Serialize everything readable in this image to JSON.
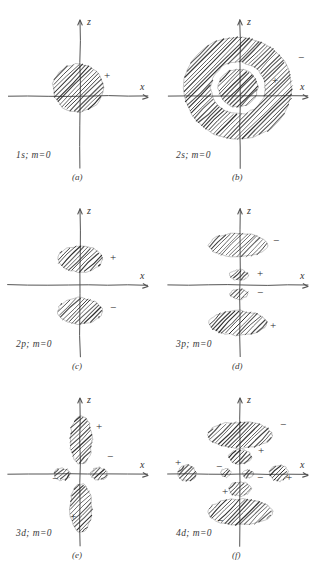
{
  "figure": {
    "background_color": "#ffffff",
    "ink_color": "#2b2b2b",
    "axis_color": "#555555"
  },
  "axes": {
    "vertical_label": "z",
    "horizontal_label": "x"
  },
  "panels": [
    {
      "id": "a",
      "caption": "(a)",
      "orbital_label": "1s; m=0",
      "orbital": "1s",
      "m": 0,
      "signs": [
        {
          "text": "+",
          "x": 104,
          "y": 79
        }
      ],
      "lobes": [
        {
          "name": "s-core-lobe",
          "shape": "disc",
          "cx": 78,
          "cy": 88,
          "rx": 25,
          "ry": 24,
          "sign": "+",
          "rotation": 0
        }
      ]
    },
    {
      "id": "b",
      "caption": "(b)",
      "orbital_label": "2s; m=0",
      "orbital": "2s",
      "m": 0,
      "signs": [
        {
          "text": "+",
          "x": 112,
          "y": 84
        },
        {
          "text": "−",
          "x": 138,
          "y": 61
        }
      ],
      "lobes": [
        {
          "name": "outer-ring",
          "shape": "annulus",
          "cx": 78,
          "cy": 88,
          "rx": 54,
          "ry": 51,
          "inner_rx": 27,
          "inner_ry": 26,
          "sign": "−"
        },
        {
          "name": "inner-disc",
          "shape": "disc",
          "cx": 78,
          "cy": 88,
          "rx": 20,
          "ry": 19,
          "sign": "+"
        }
      ]
    },
    {
      "id": "c",
      "caption": "(c)",
      "orbital_label": "2p; m=0",
      "orbital": "2p",
      "m": 0,
      "signs": [
        {
          "text": "+",
          "x": 110,
          "y": 72
        },
        {
          "text": "−",
          "x": 110,
          "y": 122
        }
      ],
      "lobes": [
        {
          "name": "upper-lobe",
          "shape": "disc",
          "cx": 80,
          "cy": 70,
          "rx": 22,
          "ry": 13,
          "sign": "+"
        },
        {
          "name": "lower-lobe",
          "shape": "disc",
          "cx": 80,
          "cy": 122,
          "rx": 22,
          "ry": 13,
          "sign": "−"
        }
      ]
    },
    {
      "id": "d",
      "caption": "(d)",
      "orbital_label": "3p; m=0",
      "orbital": "3p",
      "m": 0,
      "signs": [
        {
          "text": "−",
          "x": 113,
          "y": 55
        },
        {
          "text": "+",
          "x": 97,
          "y": 88
        },
        {
          "text": "−",
          "x": 97,
          "y": 107
        },
        {
          "text": "+",
          "x": 110,
          "y": 140
        }
      ],
      "lobes": [
        {
          "name": "outer-upper-lobe",
          "shape": "disc",
          "cx": 78,
          "cy": 56,
          "rx": 29,
          "ry": 12,
          "sign": "−"
        },
        {
          "name": "inner-upper-lobe",
          "shape": "disc",
          "cx": 79,
          "cy": 86,
          "rx": 9,
          "ry": 5,
          "sign": "+"
        },
        {
          "name": "inner-lower-lobe",
          "shape": "disc",
          "cx": 79,
          "cy": 105,
          "rx": 9,
          "ry": 5,
          "sign": "−"
        },
        {
          "name": "outer-lower-lobe",
          "shape": "disc",
          "cx": 78,
          "cy": 134,
          "rx": 29,
          "ry": 12,
          "sign": "+"
        }
      ]
    },
    {
      "id": "e",
      "caption": "(e)",
      "orbital_label": "3d; m=0",
      "orbital": "3d",
      "m": 0,
      "signs": [
        {
          "text": "+",
          "x": 96,
          "y": 52
        },
        {
          "text": "−",
          "x": 107,
          "y": 82
        },
        {
          "text": "−",
          "x": 52,
          "y": 104
        },
        {
          "text": "+",
          "x": 70,
          "y": 142
        }
      ],
      "lobes": [
        {
          "name": "upper-vertical-lobe",
          "shape": "disc",
          "cx": 81,
          "cy": 62,
          "rx": 11,
          "ry": 24,
          "sign": "+"
        },
        {
          "name": "lower-vertical-lobe",
          "shape": "disc",
          "cx": 81,
          "cy": 130,
          "rx": 11,
          "ry": 24,
          "sign": "+"
        },
        {
          "name": "left-torus-lobe",
          "shape": "disc",
          "cx": 62,
          "cy": 96,
          "rx": 8,
          "ry": 6,
          "sign": "−"
        },
        {
          "name": "right-torus-lobe",
          "shape": "disc",
          "cx": 99,
          "cy": 96,
          "rx": 8,
          "ry": 6,
          "sign": "−"
        }
      ]
    },
    {
      "id": "f",
      "caption": "(f)",
      "orbital_label": "4d; m=0",
      "orbital": "4d",
      "m": 0,
      "signs": [
        {
          "text": "−",
          "x": 120,
          "y": 50
        },
        {
          "text": "+",
          "x": 98,
          "y": 76
        },
        {
          "text": "+",
          "x": 15,
          "y": 88
        },
        {
          "text": "−",
          "x": 56,
          "y": 92
        },
        {
          "text": "−",
          "x": 97,
          "y": 103
        },
        {
          "text": "+",
          "x": 126,
          "y": 103
        },
        {
          "text": "+",
          "x": 62,
          "y": 117
        },
        {
          "text": "−",
          "x": 57,
          "y": 146
        }
      ],
      "lobes": [
        {
          "name": "outer-upper-lobe",
          "shape": "disc",
          "cx": 80,
          "cy": 57,
          "rx": 32,
          "ry": 13,
          "sign": "−"
        },
        {
          "name": "inner-upper-lobe",
          "shape": "disc",
          "cx": 80,
          "cy": 79,
          "rx": 11,
          "ry": 7,
          "sign": "+"
        },
        {
          "name": "outer-left-lobe",
          "shape": "disc",
          "cx": 27,
          "cy": 95,
          "rx": 9,
          "ry": 8,
          "sign": "+"
        },
        {
          "name": "inner-left-lobe",
          "shape": "disc",
          "cx": 66,
          "cy": 95,
          "rx": 5,
          "ry": 4,
          "sign": "−"
        },
        {
          "name": "inner-right-lobe",
          "shape": "disc",
          "cx": 88,
          "cy": 96,
          "rx": 5,
          "ry": 4,
          "sign": "−"
        },
        {
          "name": "outer-right-lobe",
          "shape": "disc",
          "cx": 119,
          "cy": 95,
          "rx": 9,
          "ry": 8,
          "sign": "+"
        },
        {
          "name": "inner-lower-lobe",
          "shape": "disc",
          "cx": 80,
          "cy": 111,
          "rx": 11,
          "ry": 7,
          "sign": "+"
        },
        {
          "name": "outer-lower-lobe",
          "shape": "disc",
          "cx": 80,
          "cy": 134,
          "rx": 32,
          "ry": 13,
          "sign": "−"
        }
      ]
    }
  ]
}
